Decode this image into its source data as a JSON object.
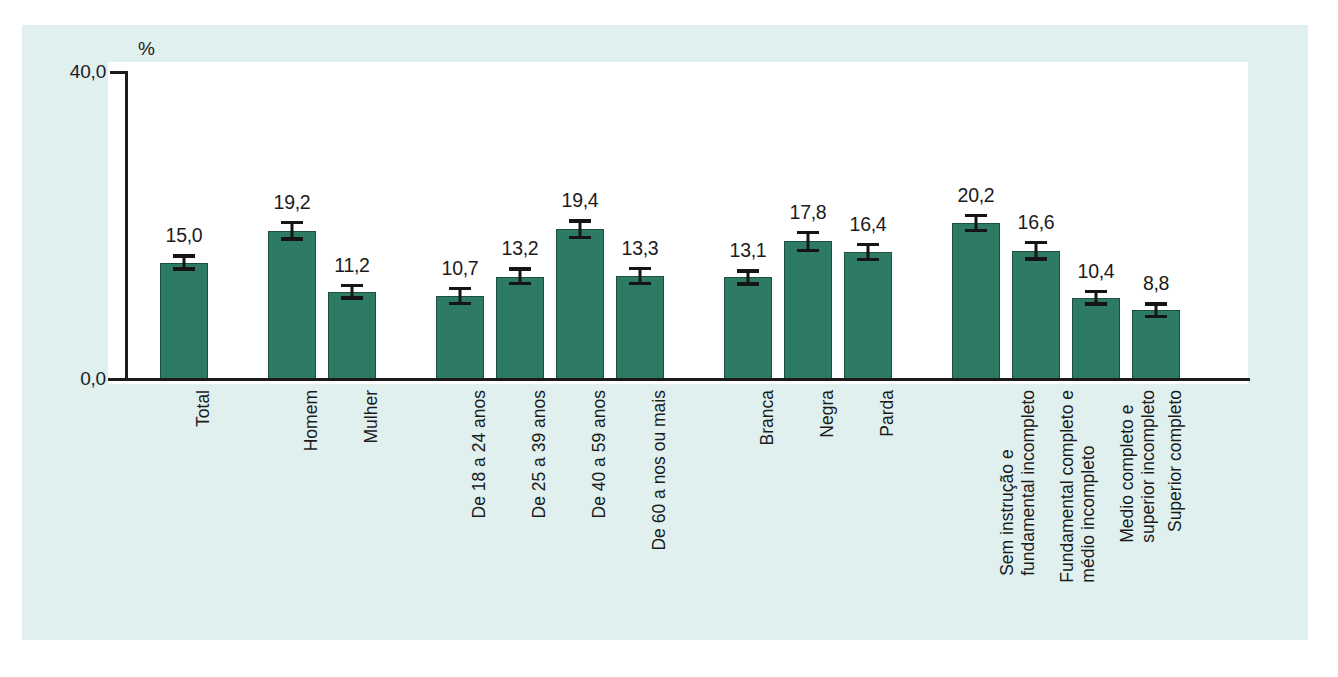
{
  "chart_data": {
    "type": "bar",
    "title": "",
    "subtitle": "",
    "xlabel": "",
    "ylabel": "",
    "unit_label": "%",
    "ylim": [
      0.0,
      40.0
    ],
    "ytick_labels": [
      "40,0",
      "0,0"
    ],
    "ytick_values": [
      40.0,
      0.0
    ],
    "grid": false,
    "legend": "none",
    "bar_color": "#2d7a65",
    "error_bars": true,
    "value_label_format": "comma-decimal",
    "groups": [
      {
        "name": "Total",
        "bars": [
          {
            "label": "Total",
            "label_lines": [
              "Total"
            ],
            "value": 15.0,
            "value_label": "15,0",
            "err_low": 14.0,
            "err_high": 16.1
          }
        ]
      },
      {
        "name": "Sexo",
        "bars": [
          {
            "label": "Homem",
            "label_lines": [
              "Homem"
            ],
            "value": 19.2,
            "value_label": "19,2",
            "err_low": 17.9,
            "err_high": 20.5
          },
          {
            "label": "Mulher",
            "label_lines": [
              "Mulher"
            ],
            "value": 11.2,
            "value_label": "11,2",
            "err_low": 10.2,
            "err_high": 12.3
          }
        ]
      },
      {
        "name": "Grupo de idade",
        "bars": [
          {
            "label": "De 18 a 24 anos",
            "label_lines": [
              "De 18 a 24 anos"
            ],
            "value": 10.7,
            "value_label": "10,7",
            "err_low": 9.5,
            "err_high": 11.9
          },
          {
            "label": "De 25 a 39 anos",
            "label_lines": [
              "De 25 a 39 anos"
            ],
            "value": 13.2,
            "value_label": "13,2",
            "err_low": 12.1,
            "err_high": 14.4
          },
          {
            "label": "De 40 a 59 anos",
            "label_lines": [
              "De 40 a 59 anos"
            ],
            "value": 19.4,
            "value_label": "19,4",
            "err_low": 18.1,
            "err_high": 20.7
          },
          {
            "label": "De 60 a nos ou mais",
            "label_lines": [
              "De 60 a nos ou mais"
            ],
            "value": 13.3,
            "value_label": "13,3",
            "err_low": 12.1,
            "err_high": 14.5
          }
        ]
      },
      {
        "name": "Cor ou raca",
        "bars": [
          {
            "label": "Branca",
            "label_lines": [
              "Branca"
            ],
            "value": 13.1,
            "value_label": "13,1",
            "err_low": 12.0,
            "err_high": 14.2
          },
          {
            "label": "Negra",
            "label_lines": [
              "Negra"
            ],
            "value": 17.8,
            "value_label": "17,8",
            "err_low": 16.4,
            "err_high": 19.2
          },
          {
            "label": "Parda",
            "label_lines": [
              "Parda"
            ],
            "value": 16.4,
            "value_label": "16,4",
            "err_low": 15.2,
            "err_high": 17.6
          }
        ]
      },
      {
        "name": "Escolaridade",
        "bars": [
          {
            "label": "Sem instrução e fundamental incompleto",
            "label_lines": [
              "Sem instrução e",
              "fundamental incompleto"
            ],
            "value": 20.2,
            "value_label": "20,2",
            "err_low": 19.0,
            "err_high": 21.4
          },
          {
            "label": "Fundamental completo e médio incompleto",
            "label_lines": [
              "Fundamental completo e",
              "médio incompleto"
            ],
            "value": 16.6,
            "value_label": "16,6",
            "err_low": 15.3,
            "err_high": 17.9
          },
          {
            "label": "Medio completo e superior incompleto",
            "label_lines": [
              "Medio completo e",
              "superior incompleto"
            ],
            "value": 10.4,
            "value_label": "10,4",
            "err_low": 9.4,
            "err_high": 11.5
          },
          {
            "label": "Superior completo",
            "label_lines": [
              "Superior completo"
            ],
            "value": 8.8,
            "value_label": "8,8",
            "err_low": 7.8,
            "err_high": 9.9
          }
        ]
      }
    ]
  },
  "bottom_caption": ""
}
